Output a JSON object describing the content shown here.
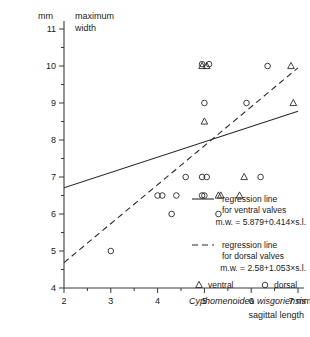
{
  "chart_data": {
    "type": "scatter",
    "title": "",
    "xlabel": "sagittal length",
    "ylabel": "maximum width",
    "x_unit": "mm",
    "y_unit": "mm",
    "xlim": [
      2,
      7
    ],
    "ylim": [
      4,
      11
    ],
    "x_ticks": [
      2,
      3,
      4,
      5,
      6,
      7
    ],
    "x_tick_labels": [
      "2",
      "3",
      "4",
      "5",
      "6",
      "7"
    ],
    "x_minor_step": 0.5,
    "y_ticks": [
      4,
      5,
      6,
      7,
      8,
      9,
      10,
      11
    ],
    "y_tick_labels": [
      "4",
      "5",
      "6",
      "7",
      "8",
      "9",
      "10",
      "11"
    ],
    "y_minor_step": 0.5,
    "grid": false,
    "legend_position": "inside-bottom-right",
    "species": "Cyphomenoidea wisgoriensis",
    "series": [
      {
        "name": "ventral",
        "marker": "triangle",
        "points": [
          [
            4.95,
            10.0
          ],
          [
            5.05,
            10.0
          ],
          [
            6.85,
            10.0
          ],
          [
            6.9,
            9.0
          ],
          [
            5.0,
            8.5
          ],
          [
            5.85,
            7.0
          ],
          [
            5.3,
            6.5
          ],
          [
            5.35,
            6.5
          ],
          [
            5.75,
            6.5
          ]
        ]
      },
      {
        "name": "dorsal",
        "marker": "circle",
        "points": [
          [
            4.95,
            10.05
          ],
          [
            5.1,
            10.05
          ],
          [
            6.35,
            10.0
          ],
          [
            5.9,
            9.0
          ],
          [
            5.0,
            9.0
          ],
          [
            4.6,
            7.0
          ],
          [
            4.95,
            7.0
          ],
          [
            5.05,
            7.0
          ],
          [
            6.2,
            7.0
          ],
          [
            4.0,
            6.5
          ],
          [
            4.1,
            6.5
          ],
          [
            4.4,
            6.5
          ],
          [
            4.95,
            6.5
          ],
          [
            5.0,
            6.5
          ],
          [
            4.3,
            6.0
          ],
          [
            5.3,
            6.0
          ],
          [
            3.0,
            5.0
          ]
        ]
      }
    ],
    "regressions": [
      {
        "name": "ventral",
        "style": "solid",
        "label_line1": "regression line",
        "label_line2": "for ventral valves",
        "equation": "m.w. = 5.879+0.414×s.l.",
        "intercept": 5.879,
        "slope": 0.414
      },
      {
        "name": "dorsal",
        "style": "dashed",
        "label_line1": "regression line",
        "label_line2": "for dorsal valves",
        "equation": "m.w. = 2.58+1.053×s.l.",
        "intercept": 2.58,
        "slope": 1.053
      }
    ],
    "marker_legend": [
      {
        "symbol": "triangle",
        "label": "ventral"
      },
      {
        "symbol": "circle",
        "label": "dorsal"
      }
    ],
    "x_axis_unit_label": "7 mm"
  }
}
